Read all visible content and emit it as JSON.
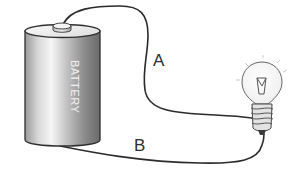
{
  "diagram": {
    "battery": {
      "label": "BATTERY"
    },
    "wires": [
      {
        "id": "A",
        "label": "A",
        "from": "battery positive terminal (top)",
        "to": "bulb screw base (side)"
      },
      {
        "id": "B",
        "label": "B",
        "from": "battery bottom",
        "to": "bulb base tip"
      }
    ],
    "bulb": {
      "state": "unlit"
    }
  },
  "colors": {
    "wire": "#2b2b2b",
    "battery_light": "#f4f4f4",
    "battery_dark": "#6e6e6e",
    "label": "#2e2e2e"
  }
}
